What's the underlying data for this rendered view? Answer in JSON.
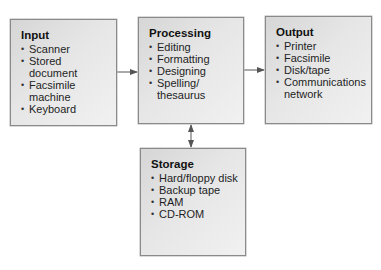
{
  "diagram": {
    "type": "block-flow",
    "nodes": {
      "input": {
        "title": "Input",
        "items": [
          "Scanner",
          "Stored document",
          "Facsimile machine",
          "Keyboard"
        ]
      },
      "processing": {
        "title": "Processing",
        "items": [
          "Editing",
          "Formatting",
          "Designing",
          "Spelling/ thesaurus"
        ]
      },
      "output": {
        "title": "Output",
        "items": [
          "Printer",
          "Facsimile",
          "Disk/tape",
          "Communications network"
        ]
      },
      "storage": {
        "title": "Storage",
        "items": [
          "Hard/floppy disk",
          "Backup tape",
          "RAM",
          "CD-ROM"
        ]
      }
    },
    "edges": [
      {
        "from": "input",
        "to": "processing",
        "direction": "one-way"
      },
      {
        "from": "processing",
        "to": "output",
        "direction": "one-way"
      },
      {
        "from": "processing",
        "to": "storage",
        "direction": "two-way"
      }
    ],
    "colors": {
      "box_fill": "#e4e4e4",
      "box_border": "#8a8a8a",
      "arrow": "#555555",
      "text": "#1a1a1a"
    }
  }
}
